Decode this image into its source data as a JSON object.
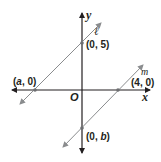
{
  "diagram": {
    "axes": {
      "x_label": "x",
      "y_label": "y",
      "origin_label": "O"
    },
    "lines": [
      {
        "name": "ℓ",
        "points": [
          {
            "label_pre": "(",
            "label_var": "a",
            "label_post": ", 0)",
            "x": "a",
            "y": 0
          },
          {
            "label": "(0, 5)",
            "x": 0,
            "y": 5
          }
        ]
      },
      {
        "name": "m",
        "points": [
          {
            "label": "(4, 0)",
            "x": 4,
            "y": 0
          },
          {
            "label_pre": "(0, ",
            "label_var": "b",
            "label_post": ")",
            "x": 0,
            "y": "b"
          }
        ]
      }
    ],
    "colors": {
      "axis": "#231f20",
      "line": "#8a8c8e",
      "point": "#6d6e71"
    }
  }
}
